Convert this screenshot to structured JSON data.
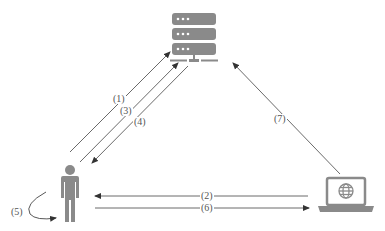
{
  "diagram": {
    "colors": {
      "icon": "#8a8a8a",
      "line": "#444444",
      "label": "#555555"
    },
    "nodes": {
      "server": {
        "icon": "server-icon"
      },
      "user": {
        "icon": "person-icon"
      },
      "client": {
        "icon": "laptop-globe-icon"
      }
    },
    "edges": [
      {
        "id": "1",
        "label": "(1)",
        "from": "user",
        "to": "server"
      },
      {
        "id": "2",
        "label": "(2)",
        "from": "client",
        "to": "user"
      },
      {
        "id": "3",
        "label": "(3)",
        "from": "user",
        "to": "server"
      },
      {
        "id": "4",
        "label": "(4)",
        "from": "server",
        "to": "user"
      },
      {
        "id": "5",
        "label": "(5)",
        "from": "user",
        "to": "user"
      },
      {
        "id": "6",
        "label": "(6)",
        "from": "user",
        "to": "client"
      },
      {
        "id": "7",
        "label": "(7)",
        "from": "client",
        "to": "server"
      }
    ]
  }
}
